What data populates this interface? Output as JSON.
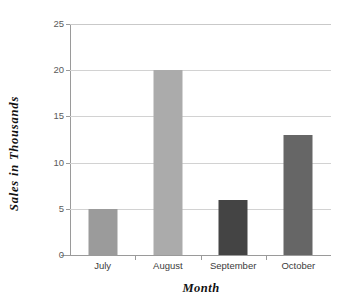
{
  "chart_data": {
    "type": "bar",
    "title": "",
    "xlabel": "Month",
    "ylabel": "Sales  in  Thousands",
    "categories": [
      "July",
      "August",
      "September",
      "October"
    ],
    "values": [
      5,
      20,
      6,
      13
    ],
    "series": [
      {
        "name": "Sales",
        "values": [
          5,
          20,
          6,
          13
        ]
      }
    ],
    "ylim": [
      0,
      25
    ],
    "yticks": [
      0,
      5,
      10,
      15,
      20,
      25
    ],
    "ytick_labels": [
      "0",
      "5",
      "10",
      "15",
      "20",
      "25"
    ],
    "xlim_categories": 4,
    "grid": "horizontal",
    "legend": "none",
    "bar_colors": [
      "#9b9b9b",
      "#ababab",
      "#444444",
      "#666666"
    ],
    "annotations": []
  },
  "axes": {
    "y_title": "Sales  in  Thousands",
    "x_title": "Month"
  },
  "colors": {
    "background": "#ffffff",
    "gridline": "#d2d2d2",
    "spine": "#9a9a9a",
    "tick_text": "#5a5a5a",
    "category_text": "#3b3b3b",
    "title_text": "#111111"
  }
}
